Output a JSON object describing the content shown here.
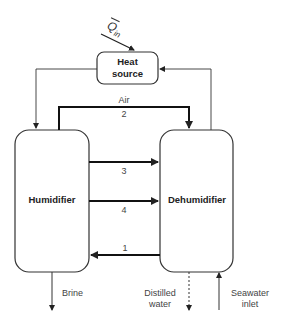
{
  "diagram": {
    "blocks": {
      "heat_source": "Heat\nsource",
      "heat_source_line1": "Heat",
      "heat_source_line2": "source",
      "humidifier": "Humidifier",
      "dehumidifier": "Dehumidifier"
    },
    "heat_input": {
      "symbol": "Q",
      "subscript": "in"
    },
    "streams": {
      "air_label": "Air",
      "s1": "1",
      "s2": "2",
      "s3": "3",
      "s4": "4"
    },
    "outputs": {
      "brine": "Brine",
      "distilled_line1": "Distilled",
      "distilled_line2": "water",
      "seawater_line1": "Seawater",
      "seawater_line2": "inlet"
    },
    "colors": {
      "stroke": "#222222",
      "text": "#444444",
      "background": "#ffffff"
    }
  }
}
